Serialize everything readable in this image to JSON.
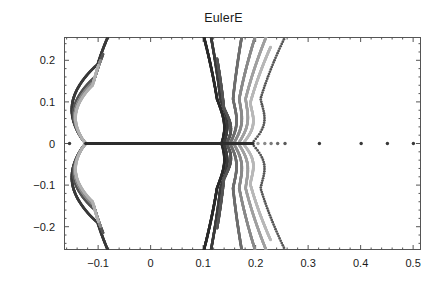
{
  "chart_data": {
    "type": "scatter",
    "title": "EulerE",
    "xlabel": "",
    "ylabel": "",
    "xlim": [
      -0.165,
      0.515
    ],
    "ylim": [
      -0.256,
      0.256
    ],
    "xticks": [
      -0.1,
      0,
      0.1,
      0.2,
      0.3,
      0.4,
      0.5
    ],
    "xticklabels": [
      "-0.1",
      "0",
      "0.1",
      "0.2",
      "0.3",
      "0.4",
      "0.5"
    ],
    "yticks": [
      0.2,
      0.1,
      0,
      -0.1,
      -0.2
    ],
    "yticklabels": [
      "0.2",
      "0.1",
      "0",
      "-0.1",
      "-0.2"
    ],
    "grid": false,
    "legend": false,
    "minor_ticks": true,
    "frame": true,
    "marker": "point",
    "marker_size": 1.6,
    "colors": {
      "darkest": "#2b2b2b",
      "mid": "#6e6e6e",
      "lightest": "#b8b8b8",
      "frame": "#555555",
      "text": "#1a1a1a"
    },
    "series": [
      {
        "name": "left-lobe-outer",
        "shade": "#3a3a3a",
        "kind": "arc",
        "cusp_x": -0.1232,
        "apex_x": -0.0815,
        "y_extent": 0.256,
        "bulge_x": -0.1545
      },
      {
        "name": "left-lobe-inner-1",
        "shade": "#555555",
        "kind": "arc",
        "cusp_x": -0.1232,
        "apex_x": -0.0905,
        "y_extent": 0.215,
        "bulge_x": -0.1505
      },
      {
        "name": "left-lobe-inner-2",
        "shade": "#8a8a8a",
        "kind": "arc",
        "cusp_x": -0.1232,
        "apex_x": -0.0955,
        "y_extent": 0.2,
        "bulge_x": -0.1475
      },
      {
        "name": "left-lobe-inner-3",
        "shade": "#b0b0b0",
        "kind": "arc",
        "cusp_x": -0.1232,
        "apex_x": -0.0995,
        "y_extent": 0.188,
        "bulge_x": -0.1455
      },
      {
        "name": "right-fan-1",
        "shade": "#2b2b2b",
        "kind": "fan",
        "cusp_x": 0.1352,
        "tip_x": 0.1015,
        "y_extent": 0.256,
        "bulge_x": 0.1442
      },
      {
        "name": "right-fan-2",
        "shade": "#3c3c3c",
        "kind": "fan",
        "cusp_x": 0.1392,
        "tip_x": 0.115,
        "y_extent": 0.256,
        "bulge_x": 0.1492
      },
      {
        "name": "right-fan-3",
        "shade": "#555555",
        "kind": "fan",
        "cusp_x": 0.1442,
        "tip_x": 0.1265,
        "y_extent": 0.204,
        "bulge_x": 0.1562
      },
      {
        "name": "right-fan-4",
        "shade": "#6e6e6e",
        "kind": "fan",
        "cusp_x": 0.1512,
        "tip_x": 0.1735,
        "y_extent": 0.256,
        "bulge_x": 0.164
      },
      {
        "name": "right-fan-5",
        "shade": "#8a8a8a",
        "kind": "fan",
        "cusp_x": 0.1582,
        "tip_x": 0.199,
        "y_extent": 0.256,
        "bulge_x": 0.1725
      },
      {
        "name": "right-fan-6",
        "shade": "#a0a0a0",
        "kind": "fan",
        "cusp_x": 0.1672,
        "tip_x": 0.22,
        "y_extent": 0.256,
        "bulge_x": 0.183
      },
      {
        "name": "right-fan-7",
        "shade": "#b8b8b8",
        "kind": "fan",
        "cusp_x": 0.1762,
        "tip_x": 0.2285,
        "y_extent": 0.232,
        "bulge_x": 0.194
      },
      {
        "name": "right-sparse-arc",
        "shade": "#555555",
        "kind": "sparse",
        "cusp_x": 0.193,
        "tip_x": 0.256,
        "y_extent": 0.256,
        "bulge_x": 0.215
      }
    ],
    "real_axis_points": [
      {
        "x": -0.1545,
        "y": 0,
        "shade": "#3a3a3a"
      },
      {
        "x": -0.1232,
        "y": 0,
        "shade": "#2b2b2b"
      },
      {
        "x": 0.2045,
        "y": 0,
        "shade": "#9a9a9a"
      },
      {
        "x": 0.2175,
        "y": 0,
        "shade": "#8a8a8a"
      },
      {
        "x": 0.2295,
        "y": 0,
        "shade": "#7a7a7a"
      },
      {
        "x": 0.242,
        "y": 0,
        "shade": "#6a6a6a"
      },
      {
        "x": 0.256,
        "y": 0,
        "shade": "#5a5a5a"
      },
      {
        "x": 0.3215,
        "y": 0,
        "shade": "#3a3a3a"
      },
      {
        "x": 0.401,
        "y": 0,
        "shade": "#3a3a3a"
      },
      {
        "x": 0.451,
        "y": 0,
        "shade": "#3a3a3a"
      },
      {
        "x": 0.5005,
        "y": 0,
        "shade": "#3a3a3a"
      }
    ],
    "real_band": {
      "x_start": -0.1232,
      "x_end": 0.195,
      "y": 0,
      "shade": "#2f2f2f",
      "note": "dense continuum of real zeros forming a solid horizontal line"
    }
  }
}
